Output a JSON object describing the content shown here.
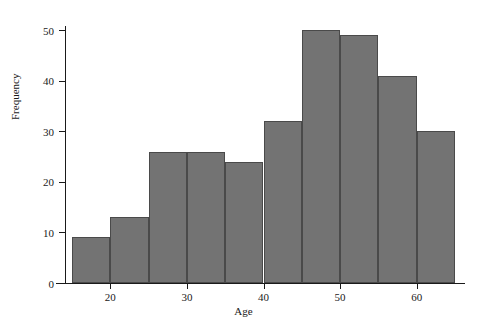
{
  "chart_data": {
    "type": "bar",
    "title": "",
    "subtitle": "",
    "xlabel": "Age",
    "ylabel": "Frequency",
    "categories": [
      "15-20",
      "20-25",
      "25-30",
      "30-35",
      "35-40",
      "40-45",
      "45-50",
      "50-55",
      "55-60",
      "60-65"
    ],
    "bin_edges": [
      15,
      20,
      25,
      30,
      35,
      40,
      45,
      50,
      55,
      60,
      65
    ],
    "bin_width": 5,
    "values": [
      9,
      13,
      26,
      26,
      24,
      32,
      50,
      49,
      41,
      30
    ],
    "xlim": [
      15,
      65
    ],
    "ylim": [
      0,
      52
    ],
    "xticks": [
      20,
      30,
      40,
      50,
      60
    ],
    "xtick_labels": [
      "20",
      "30",
      "40",
      "50",
      "60"
    ],
    "yticks": [
      0,
      10,
      20,
      30,
      40,
      50
    ],
    "ytick_labels": [
      "0",
      "10",
      "20",
      "30",
      "40",
      "50"
    ],
    "grid": false,
    "legend": null,
    "legend_position": "none",
    "bar_color": "#737373",
    "bar_edge_color": "#4a4a4a",
    "axis_color": "#1a1a1a",
    "background_color": "#ffffff"
  }
}
